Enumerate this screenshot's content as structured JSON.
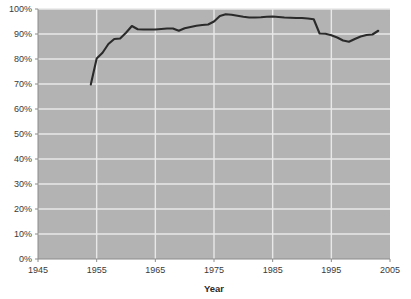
{
  "chart_data": {
    "type": "line",
    "title": "",
    "subtitle": "",
    "xlabel": "Year",
    "ylabel": "",
    "xlim": [
      1945,
      2005
    ],
    "ylim": [
      0,
      100
    ],
    "grid": true,
    "legend": "none",
    "background_color": "#b3b3b3",
    "gridline_color": "#e8e8e8",
    "line_color": "#2a2a2a",
    "xticks": [
      1945,
      1955,
      1965,
      1975,
      1985,
      1995,
      2005
    ],
    "xtick_labels": [
      "1945",
      "1955",
      "1965",
      "1975",
      "1985",
      "1995",
      "2005"
    ],
    "yticks": [
      0,
      10,
      20,
      30,
      40,
      50,
      60,
      70,
      80,
      90,
      100
    ],
    "ytick_labels": [
      "0%",
      "10%",
      "20%",
      "30%",
      "40%",
      "50%",
      "60%",
      "70%",
      "80%",
      "90%",
      "100%"
    ],
    "series": [
      {
        "name": "",
        "x": [
          1954,
          1955,
          1956,
          1957,
          1958,
          1959,
          1960,
          1961,
          1962,
          1963,
          1964,
          1965,
          1966,
          1967,
          1968,
          1969,
          1970,
          1971,
          1972,
          1973,
          1974,
          1975,
          1976,
          1977,
          1978,
          1979,
          1980,
          1981,
          1982,
          1983,
          1984,
          1985,
          1986,
          1987,
          1988,
          1989,
          1990,
          1991,
          1992,
          1993,
          1994,
          1995,
          1996,
          1997,
          1998,
          1999,
          2000,
          2001,
          2002,
          2003
        ],
        "values": [
          69.8,
          80.2,
          82.5,
          86.0,
          88.0,
          88.2,
          90.5,
          93.2,
          91.9,
          91.8,
          91.8,
          91.8,
          92.0,
          92.2,
          92.2,
          91.3,
          92.3,
          92.8,
          93.3,
          93.6,
          93.8,
          95.0,
          97.2,
          97.9,
          97.7,
          97.3,
          96.9,
          96.6,
          96.6,
          96.7,
          96.9,
          97.0,
          96.8,
          96.6,
          96.5,
          96.4,
          96.4,
          96.2,
          95.9,
          90.2,
          90.1,
          89.5,
          88.6,
          87.4,
          86.9,
          88.0,
          89.0,
          89.6,
          89.8,
          91.3
        ]
      }
    ]
  }
}
